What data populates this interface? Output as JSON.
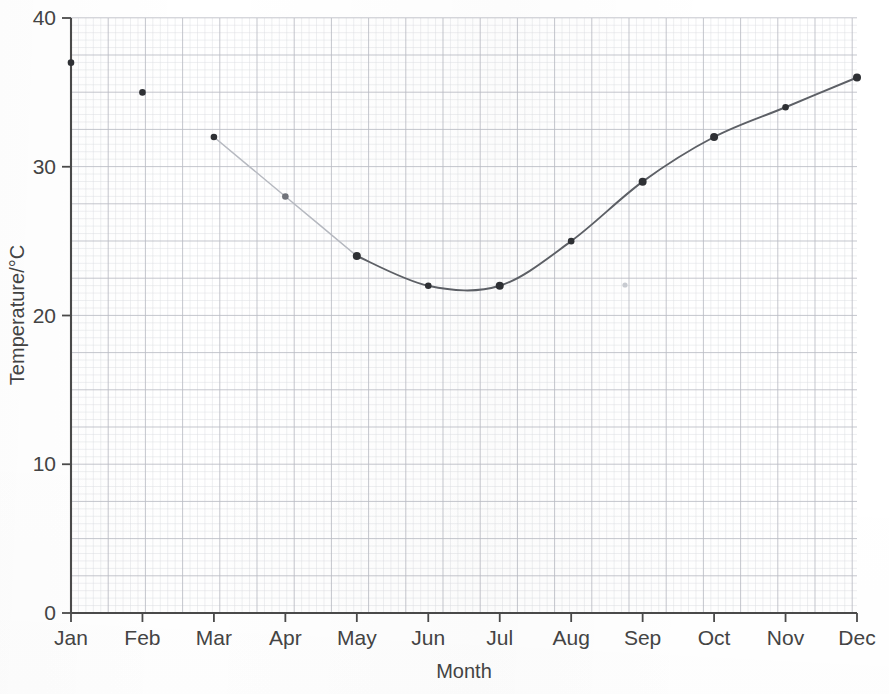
{
  "chart_data": {
    "type": "line",
    "title": "",
    "subtitle": "",
    "xlabel": "Month",
    "ylabel": "Temperature/°C",
    "categories": [
      "Jan",
      "Feb",
      "Mar",
      "Apr",
      "May",
      "Jun",
      "Jul",
      "Aug",
      "Sep",
      "Oct",
      "Nov",
      "Dec"
    ],
    "values": [
      37,
      35,
      32,
      28,
      24,
      22,
      22,
      25,
      29,
      32,
      34,
      36
    ],
    "series": [
      {
        "name": "Temperature",
        "values": [
          37,
          35,
          32,
          28,
          24,
          22,
          22,
          25,
          29,
          32,
          34,
          36
        ]
      }
    ],
    "xlim": [
      0,
      11
    ],
    "ylim": [
      0,
      40
    ],
    "ytick_labels": [
      "0",
      "10",
      "20",
      "30",
      "40"
    ],
    "ytick_values": [
      0,
      10,
      20,
      30,
      40
    ],
    "xtick_labels": [
      "Jan",
      "Feb",
      "Mar",
      "Apr",
      "May",
      "Jun",
      "Jul",
      "Aug",
      "Sep",
      "Oct",
      "Nov",
      "Dec"
    ],
    "grid": true,
    "grid_style": "graph-paper",
    "legend": "none",
    "legend_position": "none",
    "annotations": [
      {
        "label": "curve-minimum",
        "x_between": [
          "Jun",
          "Jul"
        ],
        "value": 20.8
      }
    ],
    "marker": "filled-circle",
    "line_style": "smooth-curve, faint between Mar and May",
    "colors": {
      "line": "#5d6066",
      "line_faint": "#b6b9c0",
      "marker": "#2e3034",
      "axis": "#4a4a4a",
      "grid_major": "#b9bcc4",
      "grid_minor": "#dcdee3",
      "background": "#ffffff",
      "text": "#444444"
    }
  },
  "axes": {
    "y": {
      "title": "Temperature/°C",
      "ticks": [
        {
          "label": "40",
          "value": 40
        },
        {
          "label": "30",
          "value": 30
        },
        {
          "label": "20",
          "value": 20
        },
        {
          "label": "10",
          "value": 10
        },
        {
          "label": "0",
          "value": 0
        }
      ]
    },
    "x": {
      "title": "Month",
      "ticks": [
        {
          "label": "Jan"
        },
        {
          "label": "Feb"
        },
        {
          "label": "Mar"
        },
        {
          "label": "Apr"
        },
        {
          "label": "May"
        },
        {
          "label": "Jun"
        },
        {
          "label": "Jul"
        },
        {
          "label": "Aug"
        },
        {
          "label": "Sep"
        },
        {
          "label": "Oct"
        },
        {
          "label": "Nov"
        },
        {
          "label": "Dec"
        }
      ]
    }
  }
}
